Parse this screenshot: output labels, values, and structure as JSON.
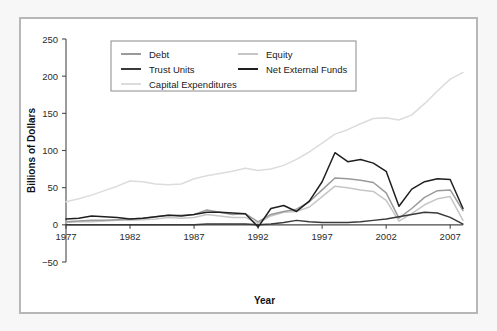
{
  "chart_data": {
    "type": "line",
    "title": "",
    "xlabel": "Year",
    "ylabel": "Billions of Dollars",
    "xlim": [
      1977,
      2008
    ],
    "ylim": [
      -50,
      250
    ],
    "xticks": [
      1977,
      1982,
      1987,
      1992,
      1997,
      2002,
      2007
    ],
    "yticks": [
      -50,
      0,
      50,
      100,
      150,
      200,
      250
    ],
    "grid": false,
    "legend_position": "top-center",
    "x": [
      1977,
      1978,
      1979,
      1980,
      1981,
      1982,
      1983,
      1984,
      1985,
      1986,
      1987,
      1988,
      1989,
      1990,
      1991,
      1992,
      1993,
      1994,
      1995,
      1996,
      1997,
      1998,
      1999,
      2000,
      2001,
      2002,
      2003,
      2004,
      2005,
      2006,
      2007,
      2008
    ],
    "series": [
      {
        "name": "Debt",
        "color": "#9a9a9a",
        "values": [
          4,
          5,
          6,
          6,
          7,
          8,
          9,
          11,
          13,
          13,
          14,
          20,
          17,
          14,
          15,
          4,
          14,
          18,
          21,
          31,
          47,
          63,
          62,
          60,
          57,
          43,
          9,
          22,
          37,
          46,
          47,
          19
        ]
      },
      {
        "name": "Equity",
        "color": "#c6c6c6",
        "values": [
          3,
          4,
          4,
          5,
          6,
          6,
          7,
          8,
          10,
          9,
          10,
          14,
          12,
          10,
          10,
          2,
          12,
          17,
          18,
          24,
          38,
          52,
          50,
          47,
          45,
          33,
          5,
          15,
          27,
          35,
          38,
          6
        ]
      },
      {
        "name": "Trust Units",
        "color": "#3a3a3a",
        "values": [
          0,
          0,
          0,
          0,
          0,
          0,
          0,
          0,
          0,
          0,
          0,
          1,
          1,
          1,
          1,
          0,
          1,
          3,
          6,
          4,
          3,
          3,
          3,
          4,
          6,
          8,
          11,
          14,
          17,
          16,
          10,
          1
        ]
      },
      {
        "name": "Net External Funds",
        "color": "#1f1f1f",
        "values": [
          8,
          9,
          12,
          11,
          10,
          8,
          9,
          11,
          13,
          12,
          14,
          17,
          17,
          16,
          15,
          -3,
          22,
          26,
          18,
          32,
          58,
          97,
          85,
          88,
          83,
          72,
          25,
          48,
          58,
          62,
          61,
          22
        ]
      },
      {
        "name": "Capital Expenditures",
        "color": "#dcdcdc",
        "values": [
          31,
          35,
          40,
          46,
          52,
          59,
          58,
          55,
          54,
          55,
          62,
          66,
          69,
          72,
          76,
          73,
          75,
          80,
          88,
          98,
          110,
          122,
          128,
          136,
          143,
          144,
          141,
          148,
          163,
          180,
          196,
          205
        ]
      }
    ],
    "legend_entries": [
      {
        "label": "Debt",
        "color": "#9a9a9a"
      },
      {
        "label": "Equity",
        "color": "#c6c6c6"
      },
      {
        "label": "Trust Units",
        "color": "#3a3a3a"
      },
      {
        "label": "Net External Funds",
        "color": "#1f1f1f"
      },
      {
        "label": "Capital Expenditures",
        "color": "#dcdcdc"
      }
    ]
  }
}
